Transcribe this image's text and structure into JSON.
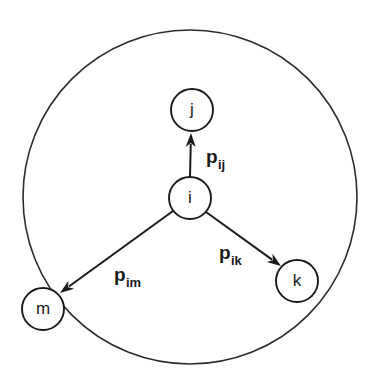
{
  "figure": {
    "title": "",
    "background_color": "#ffffff",
    "stroke_color": "#1a1a1a"
  },
  "boundary": {
    "name": "neighborhood-circle",
    "cx": 190,
    "cy": 197,
    "r": 167,
    "stroke_color": "#2b2b2b",
    "stroke_width": 1.6
  },
  "nodes": [
    {
      "id": "i",
      "label": "i",
      "cx": 190,
      "cy": 198,
      "r": 21
    },
    {
      "id": "j",
      "label": "j",
      "cx": 192,
      "cy": 110,
      "r": 21
    },
    {
      "id": "k",
      "label": "k",
      "cx": 297,
      "cy": 281,
      "r": 21
    },
    {
      "id": "m",
      "label": "m",
      "cx": 43,
      "cy": 309,
      "r": 21
    }
  ],
  "edges": [
    {
      "id": "i-j",
      "from": "i",
      "to": "j",
      "label_base": "p",
      "label_sub": "ij",
      "label_x": 206,
      "label_y": 163,
      "x1": 190,
      "y1": 177,
      "x2": 191,
      "y2": 133
    },
    {
      "id": "i-k",
      "from": "i",
      "to": "k",
      "label_base": "p",
      "label_sub": "ik",
      "label_x": 219,
      "label_y": 259,
      "x1": 206,
      "y1": 212,
      "x2": 281,
      "y2": 266
    },
    {
      "id": "i-m",
      "from": "i",
      "to": "m",
      "label_base": "p",
      "label_sub": "im",
      "label_x": 114,
      "label_y": 281,
      "x1": 173,
      "y1": 211,
      "x2": 60,
      "y2": 293
    }
  ]
}
